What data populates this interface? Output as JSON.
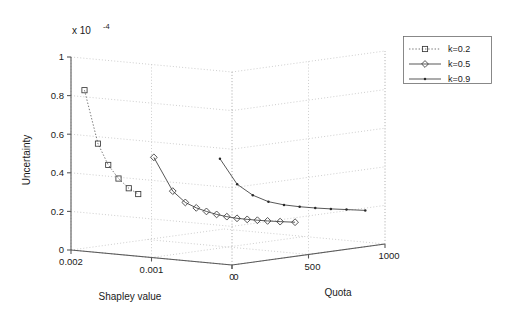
{
  "figure": {
    "exponent_label": "x 10",
    "exponent_sup": "-4",
    "y_axis_title": "Uncertainty",
    "x_axis_title": "Shapley value",
    "z_axis_title": "Quota"
  },
  "axes": {
    "y_ticks": [
      "0",
      "0.2",
      "0.4",
      "0.6",
      "0.8",
      "1"
    ],
    "x_ticks": [
      "0.002",
      "0.001",
      "0"
    ],
    "z_ticks": [
      "0",
      "500",
      "1000"
    ]
  },
  "legend": {
    "items": [
      {
        "label": "k=0.2",
        "marker": "square-marker",
        "line": "dotted"
      },
      {
        "label": "k=0.5",
        "marker": "diamond-marker",
        "line": "solid"
      },
      {
        "label": "k=0.9",
        "marker": "point-marker",
        "line": "solid"
      }
    ]
  },
  "chart_data": {
    "type": "scatter",
    "title": "",
    "projection": "3d",
    "xlabel": "Shapley value",
    "ylabel": "Quota",
    "zlabel": "Uncertainty",
    "zscale": 0.0001,
    "xlim": [
      0.002,
      0.0
    ],
    "ylim": [
      0,
      1000
    ],
    "zlim": [
      0,
      1
    ],
    "xticks": [
      0.002,
      0.001,
      0
    ],
    "yticks": [
      0,
      500,
      1000
    ],
    "zticks": [
      0,
      0.2,
      0.4,
      0.6,
      0.8,
      1
    ],
    "grid": true,
    "legend_position": "upper-right-outside",
    "series": [
      {
        "name": "k=0.2",
        "marker": "square",
        "linestyle": "dotted",
        "points": [
          {
            "shapley": 0.00188,
            "quota": 25,
            "uncertainty": 0.83
          },
          {
            "shapley": 0.00176,
            "quota": 50,
            "uncertainty": 0.555
          },
          {
            "shapley": 0.00168,
            "quota": 75,
            "uncertainty": 0.445
          },
          {
            "shapley": 0.0016,
            "quota": 100,
            "uncertainty": 0.375
          },
          {
            "shapley": 0.00152,
            "quota": 125,
            "uncertainty": 0.325
          },
          {
            "shapley": 0.00145,
            "quota": 150,
            "uncertainty": 0.295
          }
        ]
      },
      {
        "name": "k=0.5",
        "marker": "diamond",
        "linestyle": "solid",
        "points": [
          {
            "shapley": 0.00118,
            "quota": 110,
            "uncertainty": 0.5
          },
          {
            "shapley": 0.00104,
            "quota": 160,
            "uncertainty": 0.325
          },
          {
            "shapley": 0.00096,
            "quota": 200,
            "uncertainty": 0.265
          },
          {
            "shapley": 0.0009,
            "quota": 240,
            "uncertainty": 0.235
          },
          {
            "shapley": 0.00084,
            "quota": 275,
            "uncertainty": 0.215
          },
          {
            "shapley": 0.00078,
            "quota": 310,
            "uncertainty": 0.198
          },
          {
            "shapley": 0.00072,
            "quota": 345,
            "uncertainty": 0.185
          },
          {
            "shapley": 0.00066,
            "quota": 380,
            "uncertainty": 0.175
          },
          {
            "shapley": 0.0006,
            "quota": 415,
            "uncertainty": 0.168
          },
          {
            "shapley": 0.00054,
            "quota": 450,
            "uncertainty": 0.162
          },
          {
            "shapley": 0.00048,
            "quota": 485,
            "uncertainty": 0.157
          },
          {
            "shapley": 0.0004,
            "quota": 525,
            "uncertainty": 0.152
          },
          {
            "shapley": 0.0003,
            "quota": 570,
            "uncertainty": 0.148
          }
        ]
      },
      {
        "name": "k=0.9",
        "marker": "point",
        "linestyle": "solid",
        "points": [
          {
            "shapley": 0.00072,
            "quota": 300,
            "uncertainty": 0.49
          },
          {
            "shapley": 0.00062,
            "quota": 360,
            "uncertainty": 0.355
          },
          {
            "shapley": 0.00054,
            "quota": 420,
            "uncertainty": 0.295
          },
          {
            "shapley": 0.00046,
            "quota": 480,
            "uncertainty": 0.258
          },
          {
            "shapley": 0.00038,
            "quota": 540,
            "uncertainty": 0.238
          },
          {
            "shapley": 0.0003,
            "quota": 600,
            "uncertainty": 0.225
          },
          {
            "shapley": 0.00022,
            "quota": 660,
            "uncertainty": 0.215
          },
          {
            "shapley": 0.00014,
            "quota": 720,
            "uncertainty": 0.207
          },
          {
            "shapley": 6e-05,
            "quota": 780,
            "uncertainty": 0.2
          },
          {
            "shapley": -4e-05,
            "quota": 850,
            "uncertainty": 0.192
          }
        ]
      }
    ]
  }
}
